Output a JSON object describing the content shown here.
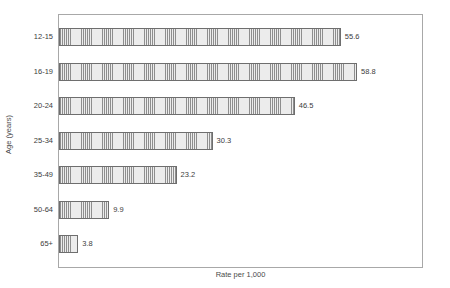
{
  "chart_data": {
    "type": "bar",
    "orientation": "horizontal",
    "title": "",
    "xlabel": "Rate per 1,000",
    "ylabel": "Age (years)",
    "categories": [
      "12-15",
      "16-19",
      "20-24",
      "25-34",
      "35-49",
      "50-64",
      "65+"
    ],
    "values": [
      55.6,
      58.8,
      46.5,
      30.3,
      23.2,
      9.9,
      3.8
    ],
    "value_labels": [
      "55.6",
      "58.8",
      "46.5",
      "30.3",
      "23.2",
      "9.9",
      "3.8"
    ],
    "xlim": [
      0,
      72
    ],
    "grid": false,
    "legend": null,
    "bar_fill": "#e9e9e9",
    "bar_hatch": "vertical-lines",
    "bar_edge_color": "#6e6e6e",
    "frame_color": "#a8a8a8",
    "background": "#ffffff"
  }
}
